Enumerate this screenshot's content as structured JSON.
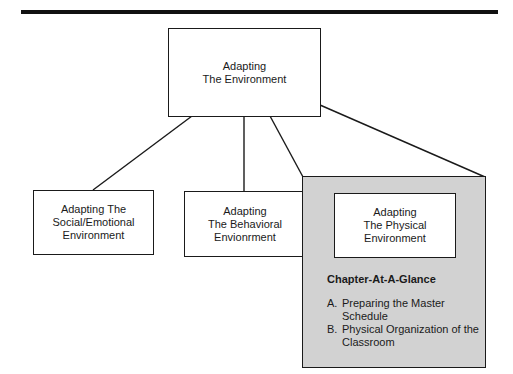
{
  "diagram": {
    "root": {
      "lines": [
        "Adapting",
        "The Environment"
      ]
    },
    "children": [
      {
        "lines": [
          "Adapting The",
          "Social/Emotional",
          "Environment"
        ]
      },
      {
        "lines": [
          "Adapting",
          "The Behavioral",
          "Envionrment"
        ]
      },
      {
        "lines": [
          "Adapting",
          "The Physical",
          "Environment"
        ]
      }
    ],
    "chapter_at_a_glance": {
      "title": "Chapter-At-A-Glance",
      "items": [
        {
          "marker": "A.",
          "text": "Preparing the Master Schedule"
        },
        {
          "marker": "B.",
          "text": "Physical Organization of the Classroom"
        }
      ]
    },
    "colors": {
      "highlight_fill": "#d2d2d2",
      "stroke": "#1a1a1a"
    }
  }
}
